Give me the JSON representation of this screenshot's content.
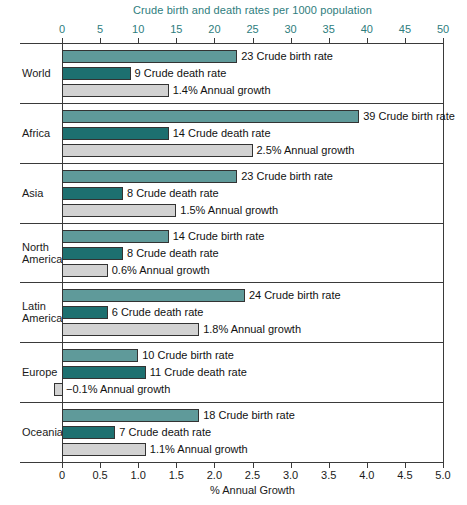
{
  "chart_data": {
    "type": "bar",
    "title": "Crude birth and death rates per 1000 population",
    "xlabel_bottom": "% Annual Growth",
    "xlabel_top": "Crude birth and death rates per 1000 population",
    "orientation": "horizontal",
    "grid": false,
    "legend": "none (inline data labels)",
    "top_axis": {
      "label": "Crude birth and death rates per 1000 population",
      "range": [
        0,
        50
      ],
      "ticks": [
        0,
        5,
        10,
        15,
        20,
        25,
        30,
        35,
        40,
        45,
        50
      ],
      "tick_labels": [
        "0",
        "5",
        "10",
        "15",
        "20",
        "25",
        "30",
        "35",
        "40",
        "45",
        "50"
      ],
      "color": "#2e7d7d"
    },
    "bottom_axis": {
      "label": "% Annual Growth",
      "range": [
        0,
        5.0
      ],
      "ticks": [
        0,
        0.5,
        1.0,
        1.5,
        2.0,
        2.5,
        3.0,
        3.5,
        4.0,
        4.5,
        5.0
      ],
      "tick_labels": [
        "0",
        "0.5",
        "1.0",
        "1.5",
        "2.0",
        "2.5",
        "3.0",
        "3.5",
        "4.0",
        "4.5",
        "5.0"
      ],
      "color": "#1a1a1a"
    },
    "colors": {
      "birth": "#5f9a9a",
      "death": "#1d7070",
      "growth": "#d2d2d2",
      "outline": "#333333",
      "top_axis_text": "#2e7d7d",
      "bottom_axis_text": "#1a1a1a"
    },
    "series": [
      {
        "name": "Crude birth rate",
        "axis": "top",
        "units": "per 1000 population",
        "values": [
          23,
          39,
          23,
          14,
          24,
          10,
          18
        ]
      },
      {
        "name": "Crude death rate",
        "axis": "top",
        "units": "per 1000 population",
        "values": [
          9,
          14,
          8,
          8,
          6,
          11,
          7
        ]
      },
      {
        "name": "Annual growth",
        "axis": "bottom",
        "units": "%",
        "values": [
          1.4,
          2.5,
          1.5,
          0.6,
          1.8,
          -0.1,
          1.1
        ]
      }
    ],
    "categories": [
      "World",
      "Africa",
      "Asia",
      "North America",
      "Latin America",
      "Europe",
      "Oceania"
    ],
    "groups": [
      {
        "region": "World",
        "region_lines": [
          "World"
        ],
        "bars": [
          {
            "type": "birth",
            "value": 23,
            "label": "23 Crude birth rate"
          },
          {
            "type": "death",
            "value": 9,
            "label": "9 Crude death rate"
          },
          {
            "type": "growth",
            "value": 1.4,
            "label": "1.4% Annual growth"
          }
        ]
      },
      {
        "region": "Africa",
        "region_lines": [
          "Africa"
        ],
        "bars": [
          {
            "type": "birth",
            "value": 39,
            "label": "39 Crude birth rate"
          },
          {
            "type": "death",
            "value": 14,
            "label": "14 Crude death rate"
          },
          {
            "type": "growth",
            "value": 2.5,
            "label": "2.5% Annual growth"
          }
        ]
      },
      {
        "region": "Asia",
        "region_lines": [
          "Asia"
        ],
        "bars": [
          {
            "type": "birth",
            "value": 23,
            "label": "23 Crude birth rate"
          },
          {
            "type": "death",
            "value": 8,
            "label": "8 Crude death rate"
          },
          {
            "type": "growth",
            "value": 1.5,
            "label": "1.5% Annual growth"
          }
        ]
      },
      {
        "region": "North America",
        "region_lines": [
          "North",
          "America"
        ],
        "bars": [
          {
            "type": "birth",
            "value": 14,
            "label": "14 Crude birth rate"
          },
          {
            "type": "death",
            "value": 8,
            "label": "8 Crude death rate"
          },
          {
            "type": "growth",
            "value": 0.6,
            "label": "0.6% Annual growth"
          }
        ]
      },
      {
        "region": "Latin America",
        "region_lines": [
          "Latin",
          "America"
        ],
        "bars": [
          {
            "type": "birth",
            "value": 24,
            "label": "24 Crude birth rate"
          },
          {
            "type": "death",
            "value": 6,
            "label": "6 Crude death rate"
          },
          {
            "type": "growth",
            "value": 1.8,
            "label": "1.8% Annual growth"
          }
        ]
      },
      {
        "region": "Europe",
        "region_lines": [
          "Europe"
        ],
        "bars": [
          {
            "type": "birth",
            "value": 10,
            "label": "10 Crude birth rate"
          },
          {
            "type": "death",
            "value": 11,
            "label": "11 Crude death rate"
          },
          {
            "type": "growth",
            "value": -0.1,
            "label": "−0.1% Annual growth"
          }
        ]
      },
      {
        "region": "Oceania",
        "region_lines": [
          "Oceania"
        ],
        "bars": [
          {
            "type": "birth",
            "value": 18,
            "label": "18 Crude birth rate"
          },
          {
            "type": "death",
            "value": 7,
            "label": "7 Crude death rate"
          },
          {
            "type": "growth",
            "value": 1.1,
            "label": "1.1% Annual growth"
          }
        ]
      }
    ]
  }
}
